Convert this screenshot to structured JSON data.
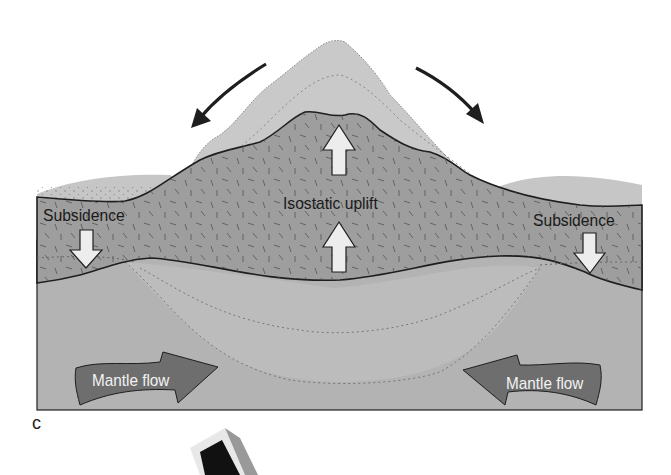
{
  "figure": {
    "panel_letter": "c",
    "labels": {
      "subsidence_left": "Subsidence",
      "subsidence_right": "Subsidence",
      "isostatic_uplift": "Isostatic uplift",
      "mantle_flow_left": "Mantle flow",
      "mantle_flow_right": "Mantle flow"
    },
    "icons": {
      "erosion_arrow_left": "curved-arrow-down-left",
      "erosion_arrow_right": "curved-arrow-down-right",
      "uplift_arrow_top": "block-arrow-up",
      "uplift_arrow_middle": "block-arrow-up",
      "subsidence_arrow_left": "block-arrow-down",
      "subsidence_arrow_right": "block-arrow-down",
      "mantle_flow_arrow_left": "ribbon-arrow-right",
      "mantle_flow_arrow_right": "ribbon-arrow-left"
    },
    "colors": {
      "mantle": "#b3b3b3",
      "crust": "#9c9c9c",
      "root": "#bfbfbf",
      "eroded_peak": "#c9c9c9",
      "sediment": "#c4c4c4",
      "outline": "#1e1e1e",
      "block_arrow": "#ededed",
      "mantle_flow_arrow": "#6e6e6e"
    }
  }
}
